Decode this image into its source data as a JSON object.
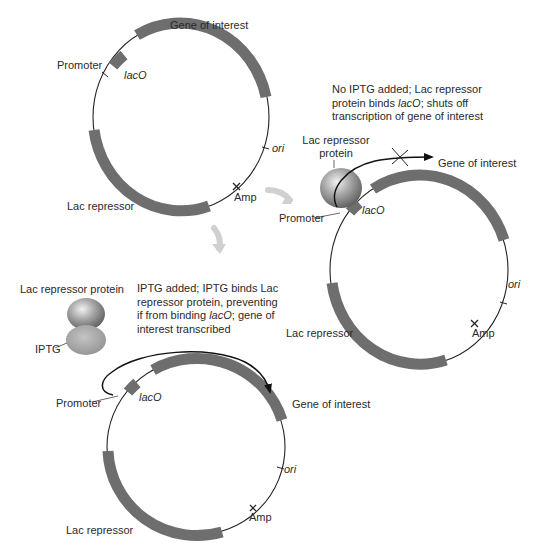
{
  "colors": {
    "gene_segment": "#6e6e6e",
    "dna_line": "#222222",
    "transition_arrow": "#d0d0d0",
    "repressor_protein": "#8a8a8a",
    "iptg": "#a9a9a9"
  },
  "panels": {
    "plasmid": {
      "labels": {
        "gene_of_interest": "Gene of interest",
        "promoter": "Promoter",
        "laco": "lacO",
        "ori": "ori",
        "amp": "Amp",
        "lac_repressor": "Lac repressor"
      }
    },
    "no_iptg": {
      "caption_parts": [
        "No IPTG added; Lac repressor",
        "protein binds ",
        "lacO",
        "; shuts off",
        "transcription of gene of interest"
      ],
      "protein_label": "Lac repressor protein",
      "labels": {
        "gene_of_interest": "Gene of interest",
        "promoter": "Promoter",
        "laco": "lacO",
        "ori": "ori",
        "amp": "Amp",
        "lac_repressor": "Lac repressor"
      }
    },
    "iptg": {
      "caption_parts": [
        "IPTG added; IPTG binds Lac",
        "repressor protein, preventing",
        "if from binding ",
        "lacO",
        "; gene of",
        "interest transcribed"
      ],
      "protein_label": "Lac repressor protein",
      "iptg_label": "IPTG",
      "labels": {
        "gene_of_interest": "Gene of interest",
        "promoter": "Promoter",
        "laco": "lacO",
        "ori": "ori",
        "amp": "Amp",
        "lac_repressor": "Lac repressor"
      }
    }
  }
}
